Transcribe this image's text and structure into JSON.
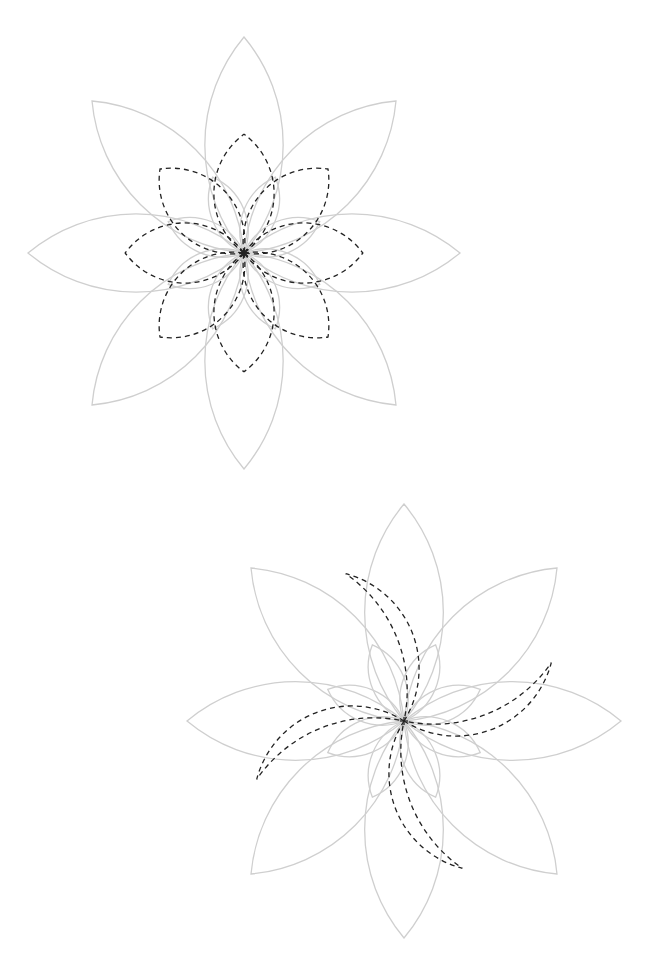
{
  "canvas": {
    "width": 645,
    "height": 957,
    "background": "#ffffff"
  },
  "colors": {
    "outline": "#cfcfcf",
    "dashed": "#222222"
  },
  "diagrams": [
    {
      "name": "flower-symmetric",
      "center": [
        244,
        253
      ],
      "tip_radius": 216,
      "corner_offset": 152,
      "petal_count": 8,
      "dashed_style": "symmetric-inner-petals",
      "center_mark": "x"
    },
    {
      "name": "flower-pinwheel",
      "center": [
        404,
        721
      ],
      "tip_radius": 217,
      "corner_offset": 153,
      "petal_count": 8,
      "dashed_style": "pinwheel-inner-petals",
      "center_mark": "plus"
    }
  ]
}
